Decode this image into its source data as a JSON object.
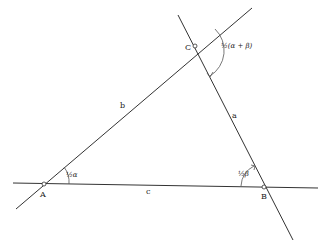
{
  "diagram": {
    "vertices": [
      {
        "id": "A",
        "label": "A",
        "x": 44,
        "y": 184
      },
      {
        "id": "B",
        "label": "B",
        "x": 264,
        "y": 187
      },
      {
        "id": "C",
        "label": "C",
        "x": 195,
        "y": 46
      }
    ],
    "sides": [
      {
        "id": "a",
        "label": "a",
        "between": [
          "B",
          "C"
        ]
      },
      {
        "id": "b",
        "label": "b",
        "between": [
          "A",
          "C"
        ]
      },
      {
        "id": "c",
        "label": "c",
        "between": [
          "A",
          "B"
        ]
      }
    ],
    "angles": [
      {
        "at": "A",
        "label": "½α"
      },
      {
        "at": "B",
        "label": "½β"
      },
      {
        "at": "C",
        "label": "½(α + β)"
      }
    ],
    "colors": {
      "line": "#333333",
      "background": "#ffffff"
    }
  }
}
